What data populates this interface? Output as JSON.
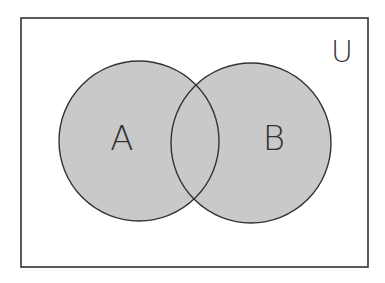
{
  "diagram": {
    "type": "venn",
    "universe": {
      "label": "U",
      "x": 21,
      "y": 18,
      "width": 347,
      "height": 249
    },
    "sets": [
      {
        "label": "A",
        "cx": 139,
        "cy": 141,
        "r": 80,
        "label_x": 122,
        "label_y": 150
      },
      {
        "label": "B",
        "cx": 251,
        "cy": 143,
        "r": 80,
        "label_x": 274,
        "label_y": 150
      }
    ],
    "colors": {
      "fill": "#c9c9c9",
      "stroke": "#333333",
      "background": "#ffffff"
    }
  }
}
